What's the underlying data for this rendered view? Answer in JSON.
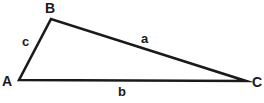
{
  "figure": {
    "type": "geometry-diagram",
    "shape": "triangle",
    "background_color": "#ffffff",
    "stroke_color": "#1a1a1a",
    "stroke_width": 2.6,
    "width": 264,
    "height": 103,
    "vertices": [
      {
        "name": "A",
        "label": "A",
        "x": 19,
        "y": 80
      },
      {
        "name": "B",
        "label": "B",
        "x": 51,
        "y": 19
      },
      {
        "name": "C",
        "label": "C",
        "x": 246,
        "y": 81
      }
    ],
    "sides": [
      {
        "name": "a",
        "label": "a",
        "from": "B",
        "to": "C",
        "label_x": 141,
        "label_y": 32
      },
      {
        "name": "b",
        "label": "b",
        "from": "A",
        "to": "C",
        "label_x": 118,
        "label_y": 85
      },
      {
        "name": "c",
        "label": "c",
        "from": "A",
        "to": "B",
        "label_x": 22,
        "label_y": 35
      }
    ],
    "vertex_labels": {
      "A": {
        "text": "A",
        "x": 2,
        "y": 74
      },
      "B": {
        "text": "B",
        "x": 45,
        "y": 1
      },
      "C": {
        "text": "C",
        "x": 252,
        "y": 75
      }
    },
    "path": "M 19 80 L 51 19 L 246 81 Z"
  }
}
